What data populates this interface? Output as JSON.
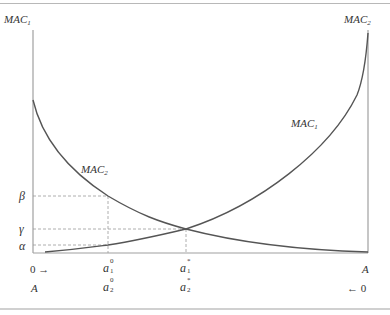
{
  "diagram": {
    "type": "marginal abatement cost curves (two-party)",
    "axes": {
      "left_label": {
        "base": "MAC",
        "sub": "1"
      },
      "right_label": {
        "base": "MAC",
        "sub": "2"
      }
    },
    "curves": [
      {
        "name": "MAC1",
        "label": {
          "base": "MAC",
          "sub": "1"
        },
        "shape": "increasing convex from left-bottom to right-top"
      },
      {
        "name": "MAC2",
        "label": {
          "base": "MAC",
          "sub": "2"
        },
        "shape": "decreasing convex from left-top to right-bottom"
      }
    ],
    "y_ticks": [
      {
        "symbol": "β"
      },
      {
        "symbol": "γ"
      },
      {
        "symbol": "α"
      }
    ],
    "x_row1": {
      "left": "0 →",
      "a10": {
        "base": "a",
        "sup": "0",
        "sub": "1"
      },
      "a1star": {
        "base": "a",
        "sup": "*",
        "sub": "1"
      },
      "right": "A"
    },
    "x_row2": {
      "left": "A",
      "a20": {
        "base": "a",
        "sup": "0",
        "sub": "2"
      },
      "a2star": {
        "base": "a",
        "sup": "*",
        "sub": "2"
      },
      "right": "← 0"
    },
    "colors": {
      "axis": "#a0a0a0",
      "curve": "#555555",
      "dashed": "#999999",
      "text": "#333333"
    }
  }
}
